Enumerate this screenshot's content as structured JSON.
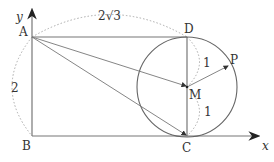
{
  "labels": {
    "A": "A",
    "B": "B",
    "C": "C",
    "D": "D",
    "M": "M",
    "P": "P",
    "x_axis": "x",
    "y_axis": "y",
    "width": "2√3",
    "height": "2",
    "DM": "1",
    "MC": "1"
  },
  "colors": {
    "line": "#777777",
    "dotted": "#aaaaaa",
    "text": "#333333"
  }
}
